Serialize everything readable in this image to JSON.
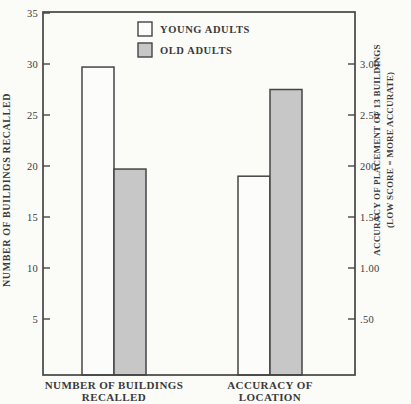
{
  "style": {
    "background": "#fbfbf8",
    "ink": "#454545",
    "text_color": "#3a3a3a",
    "young_fill": "#fcfcfa",
    "old_fill": "#c7c7c7"
  },
  "chart_data": {
    "type": "bar",
    "title": "",
    "grid": false,
    "frame": "full-box",
    "categories": [
      {
        "label_lines": [
          "NUMBER OF BUILDINGS",
          "RECALLED"
        ],
        "axis": "left"
      },
      {
        "label_lines": [
          "ACCURACY OF",
          "LOCATION"
        ],
        "axis": "right"
      }
    ],
    "series": [
      {
        "name": "YOUNG ADULTS",
        "fill": "#fcfcfa",
        "values": [
          29.7,
          1.9
        ]
      },
      {
        "name": "OLD ADULTS",
        "fill": "#c7c7c7",
        "values": [
          19.7,
          2.75
        ]
      }
    ],
    "left_axis": {
      "title": "NUMBER OF BUILDINGS RECALLED",
      "tick_labels": [
        "35",
        "30",
        "25",
        "20",
        "15",
        "10",
        "5"
      ],
      "tick_values": [
        35,
        30,
        25,
        20,
        15,
        10,
        5
      ],
      "range": [
        0,
        35
      ],
      "max": 35
    },
    "right_axis": {
      "title_lines": [
        "ACCURACY OF PLACEMENT OF 13 BUILDINGS",
        "(LOW SCORE = MORE ACCURATE)"
      ],
      "tick_labels": [
        "3.00",
        "2.50",
        "200",
        "1.50",
        "1.00",
        ".50"
      ],
      "tick_values": [
        3.0,
        2.5,
        2.0,
        1.5,
        1.0,
        0.5
      ],
      "range": [
        0,
        3.5
      ],
      "max": 3.5
    },
    "legend": {
      "position": "top-inside",
      "items": [
        {
          "label": "YOUNG ADULTS",
          "fill": "#fcfcfa"
        },
        {
          "label": "OLD ADULTS",
          "fill": "#c7c7c7"
        }
      ]
    }
  }
}
